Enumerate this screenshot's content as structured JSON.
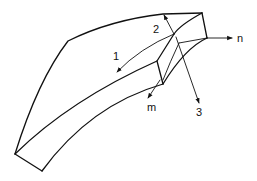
{
  "figure": {
    "labels": {
      "axis_1": "1",
      "axis_2": "2",
      "axis_3": "3",
      "normal_n": "n",
      "normal_m": "m"
    },
    "colors": {
      "line": "#111111",
      "background": "#ffffff"
    }
  }
}
